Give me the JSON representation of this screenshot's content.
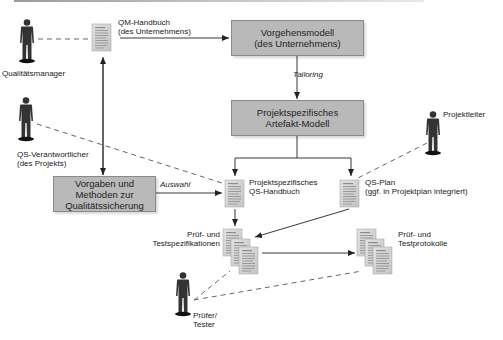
{
  "diagram": {
    "colors": {
      "box_fill": "#b9b9b9",
      "box_border": "#8a8a8a",
      "line": "#222222",
      "dashed_line": "#555555",
      "person": "#333333",
      "document": "#cfcfcf"
    },
    "actors": [
      {
        "id": "qualitaetsmanager",
        "label": "Qualitätsmanager"
      },
      {
        "id": "qs-verantwortlicher",
        "label_line1": "QS-Verantwortlicher",
        "label_line2": "(des Projekts)"
      },
      {
        "id": "projektleiter",
        "label": "Projektleiter"
      },
      {
        "id": "pruefer-tester",
        "label_line1": "Prüfer/",
        "label_line2": "Tester"
      }
    ],
    "boxes": [
      {
        "id": "vorgehensmodell",
        "line1": "Vorgehensmodell",
        "line2": "(des Unternehmens)"
      },
      {
        "id": "artefakt-modell",
        "line1": "Projektspezifisches",
        "line2": "Artefakt-Modell"
      },
      {
        "id": "vorgaben-methoden",
        "line1": "Vorgaben und",
        "line2": "Methoden zur",
        "line3": "Qualitätssicherung"
      }
    ],
    "documents": [
      {
        "id": "qm-handbuch",
        "line1": "QM-Handbuch",
        "line2": "(des Unternehmens)"
      },
      {
        "id": "qs-handbuch",
        "line1": "Projektspezifisches",
        "line2": "QS-Handbuch"
      },
      {
        "id": "qs-plan",
        "line1": "QS-Plan",
        "line2": "(ggf. in Projektplan integriert)"
      },
      {
        "id": "pruef-testspezifikationen",
        "line1": "Prüf- und",
        "line2": "Testspezifikationen"
      },
      {
        "id": "pruef-testprotokolle",
        "line1": "Prüf- und",
        "line2": "Testprotokolle"
      }
    ],
    "edge_labels": {
      "tailoring": "Tailoring",
      "auswahl": "Auswahl"
    }
  }
}
